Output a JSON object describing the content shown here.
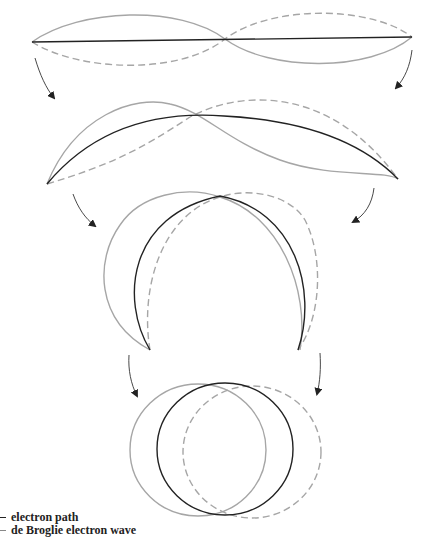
{
  "diagram": {
    "title": "",
    "stages": [
      {
        "name": "stage-1-straight",
        "description": "Straight electron path with standing de Broglie wave"
      },
      {
        "name": "stage-2-arc",
        "description": "Path bent into shallow arc"
      },
      {
        "name": "stage-3-horseshoe",
        "description": "Path bent into nearly closed loop"
      },
      {
        "name": "stage-4-circle",
        "description": "Closed circular orbit"
      }
    ],
    "colors": {
      "electron_path": "#222222",
      "wave": "#a6a6a6",
      "arrow": "#222222"
    }
  },
  "legend": {
    "items": [
      {
        "label": "electron path",
        "style": "solid-dark"
      },
      {
        "label": "de Broglie electron wave",
        "style": "gray"
      }
    ]
  }
}
